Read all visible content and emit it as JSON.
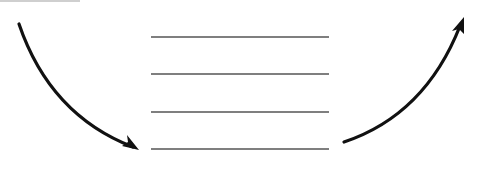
{
  "diagram": {
    "type": "flow-illustration",
    "colors": {
      "background": "#ffffff",
      "arrow": "#111111",
      "lines": "#555555",
      "top_rule": "#cfcfcf"
    },
    "lines": [
      {
        "x1": 151,
        "x2": 329,
        "y": 37
      },
      {
        "x1": 151,
        "x2": 329,
        "y": 74
      },
      {
        "x1": 151,
        "x2": 329,
        "y": 112
      },
      {
        "x1": 151,
        "x2": 329,
        "y": 149
      }
    ],
    "arrows": [
      {
        "name": "incoming-arrow",
        "direction": "down-right",
        "start": [
          19,
          24
        ],
        "end": [
          139,
          150
        ]
      },
      {
        "name": "outgoing-arrow",
        "direction": "up-right",
        "start": [
          344,
          142
        ],
        "end": [
          464,
          18
        ]
      }
    ]
  }
}
